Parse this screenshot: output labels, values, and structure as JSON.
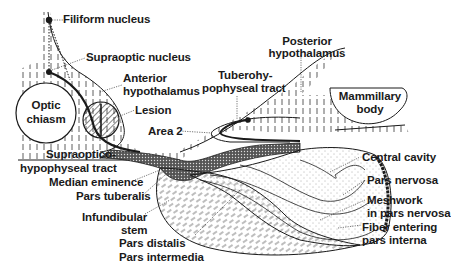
{
  "diagram": {
    "colors": {
      "ink": "#1a1a1a",
      "background": "#ffffff"
    },
    "labels": {
      "filiform_nucleus": "Filiform nucleus",
      "supraoptic_nucleus": "Supraoptic nucleus",
      "anterior_hypothalamus_1": "Anterior",
      "anterior_hypothalamus_2": "hypothalamus",
      "optic_chiasm_1": "Optic",
      "optic_chiasm_2": "chiasm",
      "lesion": "Lesion",
      "area_2": "Area 2",
      "tuberohypophyseal_1": "Tuberohy-",
      "tuberohypophyseal_2": "pophyseal tract",
      "posterior_hypothalamus_1": "Posterior",
      "posterior_hypothalamus_2": "hypothalamus",
      "mammillary_body_1": "Mammillary",
      "mammillary_body_2": "body",
      "supraoptico_1": "Supraoptico-",
      "supraoptico_2": "hypophyseal tract",
      "median_eminence": "Median eminence",
      "pars_tuberalis": "Pars tuberalis",
      "infundibular_1": "Infundibular",
      "infundibular_2": "stem",
      "pars_distalis": "Pars distalis",
      "pars_intermedia": "Pars intermedia",
      "central_cavity": "Central cavity",
      "pars_nervosa": "Pars nervosa",
      "meshwork_1": "Meshwork",
      "meshwork_2": "in pars nervosa",
      "fiber_1": "Fiber entering",
      "fiber_2": "pars interna"
    }
  }
}
